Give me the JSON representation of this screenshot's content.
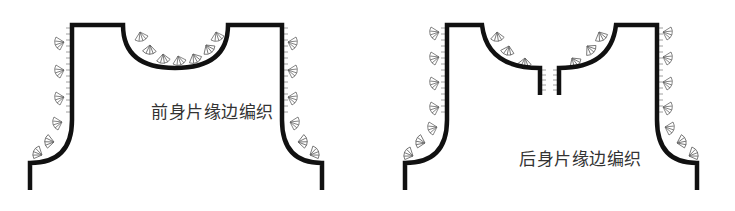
{
  "diagrams": [
    {
      "id": "front",
      "label": "前身片缘边编织",
      "label_meaning": "Front body piece edging"
    },
    {
      "id": "back",
      "label": "后身片缘边编织",
      "label_meaning": "Back body piece edging"
    }
  ],
  "colors": {
    "outline": "#111111",
    "stitch": "#777777",
    "text": "#333333",
    "background": "#ffffff"
  },
  "stitch_symbol": "fan-shell-icon"
}
